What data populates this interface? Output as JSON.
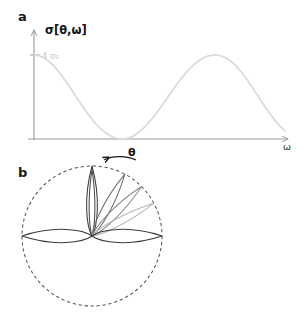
{
  "figure": {
    "panel_a_letter": "a",
    "panel_b_letter": "b"
  },
  "panel_a": {
    "y_axis_label": "σ[θ,ω]",
    "x_axis_label": "ω",
    "y_tick_label": "4 σ₀",
    "theta_label": "θ",
    "curve_color": "#d9d9d9",
    "axis_color": "#9a9a9a",
    "tick_label_color": "#c9c9c9"
  },
  "panel_b": {
    "circle_style": "dashed",
    "circle_color": "#555555",
    "lobe_colors": [
      "#3b3b3b",
      "#4a4a4a",
      "#6f6f6f",
      "#9a9a9a",
      "#bfbfbf",
      "#3b3b3b",
      "#3b3b3b"
    ]
  },
  "chart_data": [
    {
      "type": "line",
      "id": "panel-a-cross-section",
      "title": "",
      "xlabel": "ω",
      "ylabel": "σ[θ,ω]",
      "ylim": [
        0,
        4
      ],
      "xlim": [
        0,
        6.6
      ],
      "grid": false,
      "legend": null,
      "ytick_values": [
        4
      ],
      "ytick_labels": [
        "4 σ₀"
      ],
      "xtick_values": [],
      "xtick_labels": [],
      "annotations": [
        "θ"
      ],
      "description": "Oscillating cross-section starting at maximum 4 sigma-zero, with zeros and maxima repeating.",
      "x": [
        0.0,
        0.15,
        0.3,
        0.45,
        0.6,
        0.75,
        0.9,
        1.05,
        1.2,
        1.35,
        1.5,
        1.65,
        1.8,
        1.95,
        2.1,
        2.25,
        2.4,
        2.55,
        2.7,
        2.85,
        3.0,
        3.15,
        3.3,
        3.45,
        3.6,
        3.75,
        3.9,
        4.05,
        4.2,
        4.35,
        4.5,
        4.65,
        4.8,
        4.95,
        5.1,
        5.25,
        5.4,
        5.55,
        5.7,
        5.85,
        6.0,
        6.15,
        6.3,
        6.45,
        6.6
      ],
      "y": [
        4.0,
        3.95,
        3.82,
        3.6,
        3.31,
        2.96,
        2.58,
        2.17,
        1.76,
        1.37,
        1.0,
        0.68,
        0.42,
        0.21,
        0.07,
        0.01,
        0.01,
        0.09,
        0.25,
        0.47,
        0.75,
        1.07,
        1.43,
        1.81,
        2.2,
        2.59,
        2.94,
        3.26,
        3.53,
        3.75,
        3.9,
        3.98,
        4.0,
        3.94,
        3.8,
        3.59,
        3.3,
        2.96,
        2.57,
        2.16,
        1.74,
        1.34,
        0.97,
        0.65,
        0.4
      ]
    },
    {
      "type": "line",
      "id": "panel-b-polar-lobes",
      "title": "",
      "polar": true,
      "description": "Polar radiation pattern inside a dashed unit circle: a narrow vertical lobe, three progressively lighter angled lobes fanning toward the horizontal, and two broad horizontal lobes.",
      "boundary": {
        "shape": "circle",
        "radius": 1.0,
        "linestyle": "dashed"
      },
      "lobes": [
        {
          "name": "vertical-lobe",
          "angle_deg": 90,
          "length": 1.0,
          "width": 0.13,
          "shade": "#3b3b3b"
        },
        {
          "name": "vertical-lobe-inner",
          "angle_deg": 90,
          "length": 0.95,
          "width": 0.07,
          "shade": "#4a4a4a"
        },
        {
          "name": "angled-lobe-1",
          "angle_deg": 62,
          "length": 1.0,
          "width": 0.1,
          "shade": "#6f6f6f"
        },
        {
          "name": "angled-lobe-2",
          "angle_deg": 45,
          "length": 1.0,
          "width": 0.1,
          "shade": "#8c8c8c"
        },
        {
          "name": "angled-lobe-3",
          "angle_deg": 28,
          "length": 1.0,
          "width": 0.09,
          "shade": "#b5b5b5"
        },
        {
          "name": "horizontal-lobe-right",
          "angle_deg": 0,
          "length": 1.0,
          "width": 0.16,
          "shade": "#3b3b3b"
        },
        {
          "name": "horizontal-lobe-left",
          "angle_deg": 180,
          "length": 1.0,
          "width": 0.16,
          "shade": "#3b3b3b"
        }
      ]
    }
  ]
}
